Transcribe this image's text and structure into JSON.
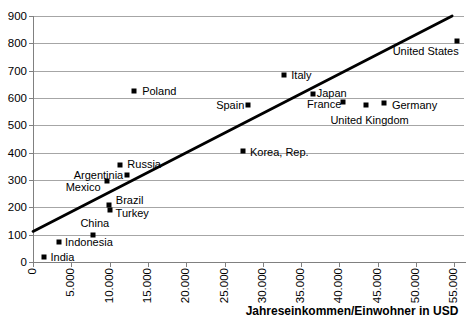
{
  "colors": {
    "background": "#ffffff",
    "gridline": "#a6a6a6",
    "axis": "#808080",
    "text": "#000000",
    "marker": "#000000",
    "trendline": "#000000"
  },
  "chart_data": {
    "type": "scatter",
    "title": "",
    "xlabel": "Jahreseinkommen/Einwohner in USD",
    "ylabel": "",
    "xlim": [
      0,
      56250
    ],
    "ylim": [
      0,
      900
    ],
    "grid": "horizontal-only",
    "legend": "none",
    "marker": {
      "shape": "square",
      "color": "#000000",
      "size": 5
    },
    "x_ticks": [
      {
        "value": 0,
        "label": "0"
      },
      {
        "value": 5000,
        "label": "5.000"
      },
      {
        "value": 10000,
        "label": "10.000"
      },
      {
        "value": 15000,
        "label": "15.000"
      },
      {
        "value": 20000,
        "label": "20.000"
      },
      {
        "value": 25000,
        "label": "25.000"
      },
      {
        "value": 30000,
        "label": "30.000"
      },
      {
        "value": 35000,
        "label": "35.000"
      },
      {
        "value": 40000,
        "label": "40.000"
      },
      {
        "value": 45000,
        "label": "45.000"
      },
      {
        "value": 50000,
        "label": "50.000"
      },
      {
        "value": 55000,
        "label": "55.000"
      }
    ],
    "y_ticks": [
      {
        "value": 0,
        "label": "0"
      },
      {
        "value": 100,
        "label": "100"
      },
      {
        "value": 200,
        "label": "200"
      },
      {
        "value": 300,
        "label": "300"
      },
      {
        "value": 400,
        "label": "400"
      },
      {
        "value": 500,
        "label": "500"
      },
      {
        "value": 600,
        "label": "600"
      },
      {
        "value": 700,
        "label": "700"
      },
      {
        "value": 800,
        "label": "800"
      },
      {
        "value": 900,
        "label": "900"
      }
    ],
    "points": [
      {
        "name": "India",
        "x": 1500,
        "y": 20,
        "anchor": "right",
        "dx": 6,
        "dy": 0
      },
      {
        "name": "Indonesia",
        "x": 3400,
        "y": 75,
        "anchor": "right",
        "dx": 6,
        "dy": 0
      },
      {
        "name": "China",
        "x": 7800,
        "y": 100,
        "anchor": "above",
        "dx": 2,
        "dy": -5
      },
      {
        "name": "Turkey",
        "x": 10000,
        "y": 190,
        "anchor": "right",
        "dx": 6,
        "dy": 3
      },
      {
        "name": "Brazil",
        "x": 9900,
        "y": 210,
        "anchor": "right",
        "dx": 7,
        "dy": -5
      },
      {
        "name": "Mexico",
        "x": 9600,
        "y": 295,
        "anchor": "left",
        "dx": -6,
        "dy": 6
      },
      {
        "name": "Argentinia",
        "x": 12300,
        "y": 320,
        "anchor": "left",
        "dx": -4,
        "dy": 0
      },
      {
        "name": "Russia",
        "x": 11400,
        "y": 355,
        "anchor": "right",
        "dx": 7,
        "dy": -1
      },
      {
        "name": "Poland",
        "x": 13200,
        "y": 625,
        "anchor": "right",
        "dx": 8,
        "dy": 0
      },
      {
        "name": "Korea, Rep.",
        "x": 27400,
        "y": 405,
        "anchor": "right",
        "dx": 7,
        "dy": 1
      },
      {
        "name": "Spain",
        "x": 28100,
        "y": 575,
        "anchor": "left",
        "dx": -4,
        "dy": 0
      },
      {
        "name": "Italy",
        "x": 32800,
        "y": 685,
        "anchor": "right",
        "dx": 7,
        "dy": 0
      },
      {
        "name": "Japan",
        "x": 36500,
        "y": 615,
        "anchor": "right",
        "dx": 4,
        "dy": -1
      },
      {
        "name": "France",
        "x": 40500,
        "y": 585,
        "anchor": "left",
        "dx": -2,
        "dy": 2
      },
      {
        "name": "United Kingdom",
        "x": 43400,
        "y": 575,
        "anchor": "below",
        "dx": 4,
        "dy": 9
      },
      {
        "name": "Germany",
        "x": 45800,
        "y": 580,
        "anchor": "right",
        "dx": 8,
        "dy": 2
      },
      {
        "name": "United States",
        "x": 55300,
        "y": 810,
        "anchor": "below-end",
        "dx": 2,
        "dy": 4
      }
    ],
    "trendline": {
      "x1": 0,
      "y1": 112,
      "x2": 54700,
      "y2": 900,
      "width": 2.8
    }
  }
}
